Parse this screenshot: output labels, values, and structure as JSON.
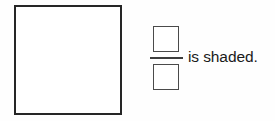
{
  "page": {
    "background_color": "#fefefe",
    "item_type": "fraction-shading-exercise"
  },
  "shape": {
    "name": "square",
    "fill_color": "#ffffff",
    "border_color": "#262626",
    "shaded_parts": "",
    "label": ""
  },
  "fraction": {
    "numerator_value": "",
    "denominator_value": "",
    "numerator_placeholder": "",
    "denominator_placeholder": "",
    "bar_color": "#3d3d3d",
    "box_border_color": "#4a4a4a"
  },
  "statement": {
    "text": "is shaded.",
    "color": "#1a1a1a"
  }
}
